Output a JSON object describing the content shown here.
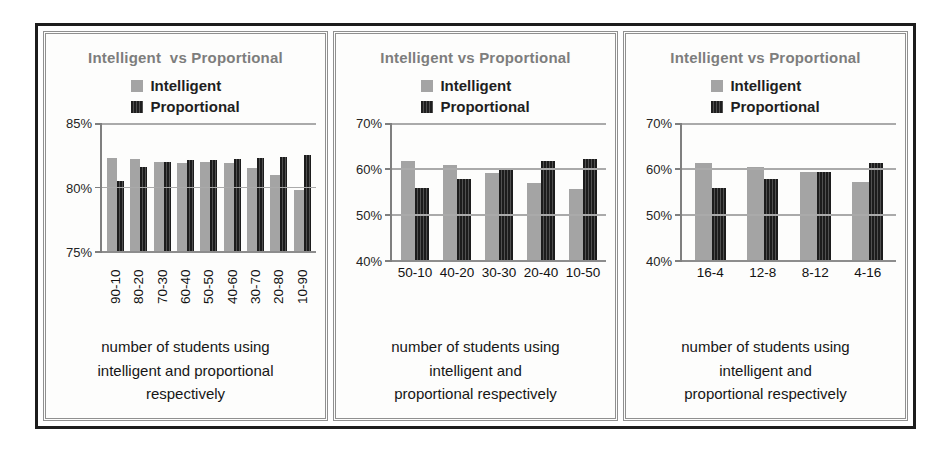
{
  "colors": {
    "intelligent_bar": "#a4a4a4",
    "proportional_bar": "#1c1c1c",
    "proportional_stripe": "#505050",
    "title_text": "#7d7d7d",
    "gridline": "#aaaaaa",
    "axis": "#7f7f7f",
    "frame_border": "#1c1c1c"
  },
  "chart_data": [
    {
      "type": "bar",
      "title": "Intelligent  vs Proportional",
      "legend_position": "top",
      "grid": true,
      "categories": [
        "90-10",
        "80-20",
        "70-30",
        "60-40",
        "50-50",
        "40-60",
        "30-70",
        "20-80",
        "10-90"
      ],
      "series": [
        {
          "name": "Intelligent",
          "values": [
            82.3,
            82.2,
            82.0,
            81.9,
            82.0,
            81.9,
            81.5,
            81.0,
            79.8
          ]
        },
        {
          "name": "Proportional",
          "values": [
            80.5,
            81.6,
            82.0,
            82.1,
            82.1,
            82.2,
            82.3,
            82.4,
            82.5
          ]
        }
      ],
      "ylim": [
        75,
        85
      ],
      "y_tick_values": [
        85,
        80,
        75
      ],
      "y_tick_labels": [
        "85%",
        "80%",
        "75%"
      ],
      "x_labels_rotated": true,
      "caption_lines": [
        "number of students using",
        "intelligent and proportional",
        "respectively"
      ],
      "layout": {
        "plot_height": 129,
        "bar_widths": [
          10,
          7
        ]
      }
    },
    {
      "type": "bar",
      "title": "Intelligent vs Proportional",
      "legend_position": "top",
      "grid": true,
      "categories": [
        "50-10",
        "40-20",
        "30-30",
        "20-40",
        "10-50"
      ],
      "series": [
        {
          "name": "Intelligent",
          "values": [
            61.8,
            60.9,
            59.2,
            57.0,
            55.6
          ]
        },
        {
          "name": "Proportional",
          "values": [
            55.8,
            57.9,
            60.1,
            61.7,
            62.2
          ]
        }
      ],
      "ylim": [
        40,
        70
      ],
      "y_tick_values": [
        70,
        60,
        50,
        40
      ],
      "y_tick_labels": [
        "70%",
        "60%",
        "50%",
        "40%"
      ],
      "x_labels_rotated": false,
      "caption_lines": [
        "number of students using",
        "intelligent and",
        "proportional respectively"
      ],
      "layout": {
        "plot_height": 138,
        "bar_widths": [
          14,
          14
        ]
      }
    },
    {
      "type": "bar",
      "title": "Intelligent vs Proportional",
      "legend_position": "top",
      "grid": true,
      "categories": [
        "16-4",
        "12-8",
        "8-12",
        "4-16"
      ],
      "series": [
        {
          "name": "Intelligent",
          "values": [
            61.2,
            60.5,
            59.4,
            57.1
          ]
        },
        {
          "name": "Proportional",
          "values": [
            55.8,
            57.8,
            59.4,
            61.2
          ]
        }
      ],
      "ylim": [
        40,
        70
      ],
      "y_tick_values": [
        70,
        60,
        50,
        40
      ],
      "y_tick_labels": [
        "70%",
        "60%",
        "50%",
        "40%"
      ],
      "x_labels_rotated": false,
      "caption_lines": [
        "number of students using",
        "intelligent and",
        "proportional respectively"
      ],
      "layout": {
        "plot_height": 138,
        "bar_widths": [
          17,
          14
        ]
      }
    }
  ]
}
